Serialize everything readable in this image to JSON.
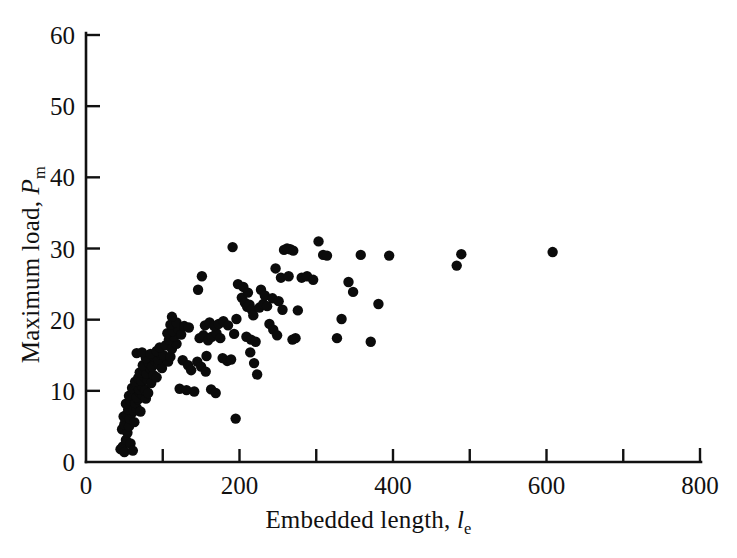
{
  "figure": {
    "background_color": "#ffffff",
    "point_color": "#0b0b0b",
    "axis_color": "#111111"
  },
  "axis_titles": {
    "x_prefix": "Embedded length, ",
    "x_symbol": "l",
    "x_subscript": "e",
    "y_prefix": "Maximum load, ",
    "y_symbol": "P",
    "y_subscript": "m"
  },
  "chart_data": {
    "type": "scatter",
    "title": "",
    "xlabel": "Embedded length, l_e",
    "ylabel": "Maximum load, P_m",
    "xlim": [
      0,
      800
    ],
    "ylim": [
      0,
      60
    ],
    "grid": false,
    "legend": null,
    "x_ticks": [
      0,
      100,
      200,
      300,
      400,
      500,
      600,
      700,
      800
    ],
    "x_tick_labels": [
      "0",
      "",
      "200",
      "",
      "400",
      "",
      "600",
      "",
      "800"
    ],
    "y_ticks": [
      0,
      10,
      20,
      30,
      40,
      50,
      60
    ],
    "y_tick_labels": [
      "0",
      "10",
      "20",
      "30",
      "40",
      "50",
      "60"
    ],
    "marker": "filled-circle",
    "marker_size": 6,
    "n_points": 166,
    "points": [
      [
        45,
        1.8
      ],
      [
        48,
        2.2
      ],
      [
        50,
        1.4
      ],
      [
        52,
        3.1
      ],
      [
        47,
        4.6
      ],
      [
        54,
        4.1
      ],
      [
        50,
        5.3
      ],
      [
        56,
        5.0
      ],
      [
        58,
        2.6
      ],
      [
        61,
        1.6
      ],
      [
        49,
        6.4
      ],
      [
        53,
        6.7
      ],
      [
        57,
        6.1
      ],
      [
        60,
        6.9
      ],
      [
        63,
        5.6
      ],
      [
        55,
        7.4
      ],
      [
        59,
        7.9
      ],
      [
        62,
        7.2
      ],
      [
        66,
        7.6
      ],
      [
        52,
        8.2
      ],
      [
        58,
        8.6
      ],
      [
        64,
        8.3
      ],
      [
        68,
        8.8
      ],
      [
        71,
        7.1
      ],
      [
        56,
        9.3
      ],
      [
        61,
        9.6
      ],
      [
        66,
        9.1
      ],
      [
        70,
        9.8
      ],
      [
        74,
        9.4
      ],
      [
        78,
        8.9
      ],
      [
        60,
        10.4
      ],
      [
        65,
        10.8
      ],
      [
        69,
        10.2
      ],
      [
        73,
        10.6
      ],
      [
        77,
        10.1
      ],
      [
        81,
        9.7
      ],
      [
        64,
        11.3
      ],
      [
        68,
        11.8
      ],
      [
        72,
        11.4
      ],
      [
        76,
        12.0
      ],
      [
        80,
        11.6
      ],
      [
        85,
        11.1
      ],
      [
        70,
        12.6
      ],
      [
        75,
        12.9
      ],
      [
        79,
        12.4
      ],
      [
        84,
        13.1
      ],
      [
        88,
        12.2
      ],
      [
        92,
        11.9
      ],
      [
        74,
        13.6
      ],
      [
        82,
        13.9
      ],
      [
        86,
        13.4
      ],
      [
        90,
        14.2
      ],
      [
        95,
        13.7
      ],
      [
        99,
        13.2
      ],
      [
        78,
        14.6
      ],
      [
        88,
        14.9
      ],
      [
        94,
        14.4
      ],
      [
        98,
        15.1
      ],
      [
        103,
        14.7
      ],
      [
        107,
        14.1
      ],
      [
        66,
        15.3
      ],
      [
        73,
        15.4
      ],
      [
        84,
        15.2
      ],
      [
        92,
        15.6
      ],
      [
        101,
        15.0
      ],
      [
        110,
        14.8
      ],
      [
        96,
        16.1
      ],
      [
        104,
        16.4
      ],
      [
        112,
        15.9
      ],
      [
        118,
        16.6
      ],
      [
        108,
        17.2
      ],
      [
        115,
        17.6
      ],
      [
        106,
        18.1
      ],
      [
        113,
        18.4
      ],
      [
        120,
        18.7
      ],
      [
        124,
        17.9
      ],
      [
        110,
        19.3
      ],
      [
        118,
        19.6
      ],
      [
        112,
        20.4
      ],
      [
        128,
        19.1
      ],
      [
        134,
        18.9
      ],
      [
        122,
        10.3
      ],
      [
        131,
        10.1
      ],
      [
        141,
        9.9
      ],
      [
        126,
        14.3
      ],
      [
        133,
        13.6
      ],
      [
        137,
        12.9
      ],
      [
        145,
        14.1
      ],
      [
        150,
        13.4
      ],
      [
        156,
        12.7
      ],
      [
        148,
        17.4
      ],
      [
        153,
        17.8
      ],
      [
        159,
        17.1
      ],
      [
        164,
        17.6
      ],
      [
        170,
        18.1
      ],
      [
        175,
        17.4
      ],
      [
        155,
        19.2
      ],
      [
        161,
        19.6
      ],
      [
        167,
        19.1
      ],
      [
        173,
        19.4
      ],
      [
        179,
        19.8
      ],
      [
        185,
        19.2
      ],
      [
        146,
        24.2
      ],
      [
        151,
        26.1
      ],
      [
        157,
        14.9
      ],
      [
        163,
        10.2
      ],
      [
        169,
        9.7
      ],
      [
        178,
        14.6
      ],
      [
        184,
        14.2
      ],
      [
        189,
        14.4
      ],
      [
        193,
        18.0
      ],
      [
        196,
        20.1
      ],
      [
        191,
        30.2
      ],
      [
        195,
        6.1
      ],
      [
        198,
        25.0
      ],
      [
        203,
        23.1
      ],
      [
        207,
        22.4
      ],
      [
        210,
        21.8
      ],
      [
        213,
        22.1
      ],
      [
        216,
        21.4
      ],
      [
        205,
        24.6
      ],
      [
        211,
        23.8
      ],
      [
        218,
        20.6
      ],
      [
        214,
        15.4
      ],
      [
        219,
        13.9
      ],
      [
        223,
        12.3
      ],
      [
        209,
        17.6
      ],
      [
        215,
        17.2
      ],
      [
        221,
        16.9
      ],
      [
        226,
        21.7
      ],
      [
        231,
        22.2
      ],
      [
        236,
        21.9
      ],
      [
        228,
        24.2
      ],
      [
        233,
        23.4
      ],
      [
        239,
        19.4
      ],
      [
        244,
        18.6
      ],
      [
        249,
        17.8
      ],
      [
        243,
        23.0
      ],
      [
        251,
        22.6
      ],
      [
        256,
        21.4
      ],
      [
        247,
        27.2
      ],
      [
        254,
        25.9
      ],
      [
        258,
        29.8
      ],
      [
        262,
        30.0
      ],
      [
        266,
        29.9
      ],
      [
        270,
        29.7
      ],
      [
        264,
        26.1
      ],
      [
        269,
        17.2
      ],
      [
        273,
        17.4
      ],
      [
        276,
        21.3
      ],
      [
        281,
        25.9
      ],
      [
        288,
        26.1
      ],
      [
        296,
        25.6
      ],
      [
        303,
        31.0
      ],
      [
        309,
        29.1
      ],
      [
        314,
        29.0
      ],
      [
        327,
        17.4
      ],
      [
        333,
        20.1
      ],
      [
        342,
        25.3
      ],
      [
        348,
        23.9
      ],
      [
        358,
        29.1
      ],
      [
        371,
        16.9
      ],
      [
        381,
        22.2
      ],
      [
        395,
        29.0
      ],
      [
        483,
        27.6
      ],
      [
        489,
        29.2
      ],
      [
        608,
        29.5
      ]
    ]
  }
}
